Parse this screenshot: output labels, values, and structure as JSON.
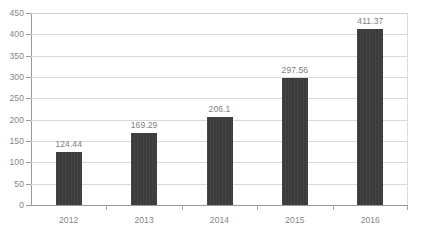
{
  "chart_data": {
    "type": "bar",
    "title": "",
    "subtitle": "",
    "xlabel": "",
    "ylabel": "",
    "categories": [
      "2012",
      "2013",
      "2014",
      "2015",
      "2016"
    ],
    "values": [
      124.44,
      169.29,
      206.1,
      297.56,
      411.37
    ],
    "data_labels": [
      "124.44",
      "169.29",
      "206.1",
      "297.56",
      "411.37"
    ],
    "series": [
      {
        "name": "",
        "values": [
          124.44,
          169.29,
          206.1,
          297.56,
          411.37
        ]
      }
    ],
    "ylim": [
      0,
      450
    ],
    "y_ticks": [
      0,
      50,
      100,
      150,
      200,
      250,
      300,
      350,
      400,
      450
    ],
    "y_tick_labels": [
      "0",
      "50",
      "100",
      "150",
      "200",
      "250",
      "300",
      "350",
      "400",
      "450"
    ],
    "grid": true,
    "grid_axis": "y",
    "legend": false,
    "legend_position": "none",
    "bar_color": "#3b3b3b",
    "gridline_color": "#d9d9d9",
    "axis_color": "#9a9a9a",
    "label_color": "#858585",
    "annotations": []
  }
}
